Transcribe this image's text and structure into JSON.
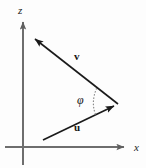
{
  "figure": {
    "background_color": "#fdfdfd",
    "width": 146,
    "height": 168
  },
  "axes": {
    "stroke_color": "#6e6e6e",
    "vertical": {
      "name": "z",
      "label": "z",
      "x": 23,
      "y_top": 19,
      "y_bottom": 165,
      "arrow_at": "top"
    },
    "horizontal": {
      "name": "x",
      "label": "x",
      "y": 147,
      "x_left": 5,
      "x_right": 128,
      "arrow_at": "right"
    }
  },
  "vectors": [
    {
      "name": "v",
      "label": "v",
      "stroke_color": "#1a1a1a",
      "tail": {
        "x": 118,
        "y": 104
      },
      "tip": {
        "x": 31,
        "y": 36
      },
      "label_position": {
        "x": 74,
        "y": 51
      }
    },
    {
      "name": "u",
      "label": "u",
      "stroke_color": "#1a1a1a",
      "tail": {
        "x": 43,
        "y": 140
      },
      "tip": {
        "x": 118,
        "y": 104
      },
      "label_position": {
        "x": 74,
        "y": 122
      }
    }
  ],
  "angle": {
    "name": "phi",
    "label": "φ",
    "between": [
      "u",
      "v"
    ],
    "vertex": {
      "x": 118,
      "y": 104
    },
    "arc_style": "dotted",
    "arc_color": "#8a8a8a",
    "label_position": {
      "x": 77,
      "y": 94
    }
  }
}
